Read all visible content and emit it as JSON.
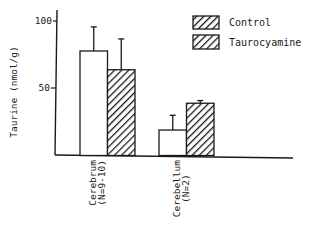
{
  "chart_data": {
    "type": "bar",
    "title": "",
    "xlabel": "",
    "ylabel": "Taurine (nmol/g)",
    "ylim": [
      0,
      110
    ],
    "yticks": [
      50,
      100
    ],
    "grid": false,
    "legend_position": "top-right",
    "categories": [
      "Cerebrum\n(N=9-10)",
      "Cerebellum\n(N=2)"
    ],
    "category_lines": [
      [
        "Cerebrum",
        "(N=9-10)"
      ],
      [
        "Cerebellum",
        "(N=2)"
      ]
    ],
    "series": [
      {
        "name": "Control",
        "pattern": "open",
        "values": [
          78,
          19
        ],
        "error_upper": [
          96,
          30
        ]
      },
      {
        "name": "Taurocyamine",
        "pattern": "hatched",
        "values": [
          64,
          39
        ],
        "error_upper": [
          87,
          41
        ]
      }
    ]
  },
  "colors": {
    "ink": "#1a1a1a",
    "background": "#ffffff"
  }
}
